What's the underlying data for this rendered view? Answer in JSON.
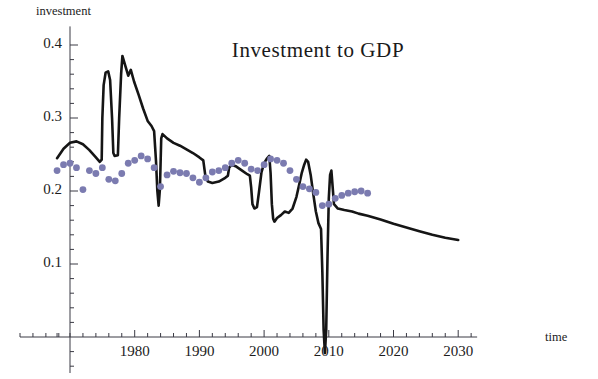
{
  "chart_data": {
    "type": "line",
    "title": "Investment to GDP",
    "xlabel": "time",
    "ylabel": "investment",
    "xlim": [
      1967,
      2032
    ],
    "ylim": [
      -0.03,
      0.42
    ],
    "grid": false,
    "legend": "none",
    "x_tick_labels": [
      "1980",
      "1990",
      "2000",
      "2010",
      "2020",
      "2030"
    ],
    "x_tick_values": [
      1980,
      1990,
      2000,
      2010,
      2020,
      2030
    ],
    "x_minor_tick_step": 2,
    "y_tick_labels": [
      "0.1",
      "0.2",
      "0.3",
      "0.4"
    ],
    "y_tick_values": [
      0.1,
      0.2,
      0.3,
      0.4
    ],
    "y_minor_tick_step": 0.02,
    "series": [
      {
        "name": "model-line",
        "type": "line",
        "color": "#151515",
        "width": 2.6,
        "points": [
          [
            1968.0,
            0.245
          ],
          [
            1969.0,
            0.258
          ],
          [
            1970.0,
            0.266
          ],
          [
            1971.0,
            0.268
          ],
          [
            1972.0,
            0.264
          ],
          [
            1973.0,
            0.256
          ],
          [
            1974.0,
            0.246
          ],
          [
            1974.6,
            0.24
          ],
          [
            1974.9,
            0.243
          ],
          [
            1975.0,
            0.3
          ],
          [
            1975.2,
            0.345
          ],
          [
            1975.5,
            0.362
          ],
          [
            1975.9,
            0.364
          ],
          [
            1976.2,
            0.352
          ],
          [
            1976.5,
            0.3
          ],
          [
            1976.7,
            0.252
          ],
          [
            1976.9,
            0.248
          ],
          [
            1977.4,
            0.249
          ],
          [
            1977.6,
            0.3
          ],
          [
            1977.9,
            0.36
          ],
          [
            1978.1,
            0.385
          ],
          [
            1978.6,
            0.37
          ],
          [
            1979.0,
            0.358
          ],
          [
            1979.4,
            0.366
          ],
          [
            1979.9,
            0.35
          ],
          [
            1980.6,
            0.332
          ],
          [
            1981.3,
            0.313
          ],
          [
            1982.0,
            0.296
          ],
          [
            1982.6,
            0.289
          ],
          [
            1983.0,
            0.282
          ],
          [
            1983.3,
            0.24
          ],
          [
            1983.5,
            0.2
          ],
          [
            1983.7,
            0.18
          ],
          [
            1983.9,
            0.203
          ],
          [
            1984.1,
            0.272
          ],
          [
            1984.3,
            0.278
          ],
          [
            1985.0,
            0.272
          ],
          [
            1986.0,
            0.266
          ],
          [
            1987.0,
            0.262
          ],
          [
            1988.0,
            0.257
          ],
          [
            1989.0,
            0.252
          ],
          [
            1990.0,
            0.246
          ],
          [
            1990.6,
            0.242
          ],
          [
            1990.9,
            0.222
          ],
          [
            1991.3,
            0.213
          ],
          [
            1992.0,
            0.211
          ],
          [
            1993.0,
            0.213
          ],
          [
            1993.6,
            0.216
          ],
          [
            1994.0,
            0.218
          ],
          [
            1994.4,
            0.221
          ],
          [
            1994.6,
            0.232
          ],
          [
            1995.0,
            0.236
          ],
          [
            1995.6,
            0.234
          ],
          [
            1996.6,
            0.228
          ],
          [
            1997.4,
            0.223
          ],
          [
            1997.8,
            0.221
          ],
          [
            1998.0,
            0.205
          ],
          [
            1998.2,
            0.182
          ],
          [
            1998.5,
            0.176
          ],
          [
            1998.9,
            0.178
          ],
          [
            1999.2,
            0.198
          ],
          [
            1999.6,
            0.226
          ],
          [
            2000.0,
            0.238
          ],
          [
            2000.4,
            0.244
          ],
          [
            2000.8,
            0.248
          ],
          [
            2001.0,
            0.225
          ],
          [
            2001.2,
            0.182
          ],
          [
            2001.4,
            0.162
          ],
          [
            2001.6,
            0.158
          ],
          [
            2002.0,
            0.163
          ],
          [
            2002.6,
            0.167
          ],
          [
            2003.2,
            0.172
          ],
          [
            2003.8,
            0.17
          ],
          [
            2004.4,
            0.176
          ],
          [
            2005.0,
            0.192
          ],
          [
            2005.4,
            0.208
          ],
          [
            2005.8,
            0.224
          ],
          [
            2006.2,
            0.236
          ],
          [
            2006.5,
            0.243
          ],
          [
            2006.8,
            0.24
          ],
          [
            2007.2,
            0.222
          ],
          [
            2007.6,
            0.196
          ],
          [
            2008.0,
            0.172
          ],
          [
            2008.4,
            0.156
          ],
          [
            2008.8,
            0.148
          ],
          [
            2009.0,
            0.09
          ],
          [
            2009.2,
            0.01
          ],
          [
            2009.4,
            -0.022
          ],
          [
            2009.6,
            0.01
          ],
          [
            2009.8,
            0.11
          ],
          [
            2010.0,
            0.19
          ],
          [
            2010.2,
            0.222
          ],
          [
            2010.4,
            0.228
          ],
          [
            2010.8,
            0.182
          ],
          [
            2011.4,
            0.176
          ],
          [
            2012.4,
            0.174
          ],
          [
            2013.6,
            0.172
          ],
          [
            2014.6,
            0.169
          ],
          [
            2016.0,
            0.166
          ],
          [
            2018.0,
            0.161
          ],
          [
            2020.0,
            0.155
          ],
          [
            2022.0,
            0.15
          ],
          [
            2024.0,
            0.145
          ],
          [
            2026.0,
            0.14
          ],
          [
            2028.0,
            0.136
          ],
          [
            2030.0,
            0.133
          ]
        ]
      },
      {
        "name": "data-dots",
        "type": "scatter",
        "color": "#7b7bb0",
        "radius": 3.4,
        "points": [
          [
            1968.0,
            0.228
          ],
          [
            1969.0,
            0.236
          ],
          [
            1970.0,
            0.238
          ],
          [
            1971.0,
            0.232
          ],
          [
            1972.0,
            0.202
          ],
          [
            1973.0,
            0.228
          ],
          [
            1974.0,
            0.224
          ],
          [
            1975.0,
            0.232
          ],
          [
            1976.0,
            0.216
          ],
          [
            1977.0,
            0.214
          ],
          [
            1978.0,
            0.224
          ],
          [
            1979.0,
            0.238
          ],
          [
            1980.0,
            0.242
          ],
          [
            1981.0,
            0.248
          ],
          [
            1982.0,
            0.244
          ],
          [
            1983.0,
            0.232
          ],
          [
            1984.0,
            0.206
          ],
          [
            1985.0,
            0.222
          ],
          [
            1986.0,
            0.227
          ],
          [
            1987.0,
            0.225
          ],
          [
            1988.0,
            0.224
          ],
          [
            1989.0,
            0.218
          ],
          [
            1990.0,
            0.212
          ],
          [
            1991.0,
            0.218
          ],
          [
            1992.0,
            0.226
          ],
          [
            1993.0,
            0.228
          ],
          [
            1994.0,
            0.232
          ],
          [
            1995.0,
            0.238
          ],
          [
            1996.0,
            0.242
          ],
          [
            1997.0,
            0.238
          ],
          [
            1998.0,
            0.23
          ],
          [
            1999.0,
            0.228
          ],
          [
            2000.0,
            0.236
          ],
          [
            2001.0,
            0.244
          ],
          [
            2002.0,
            0.242
          ],
          [
            2003.0,
            0.238
          ],
          [
            2004.0,
            0.228
          ],
          [
            2005.0,
            0.216
          ],
          [
            2006.0,
            0.206
          ],
          [
            2007.0,
            0.203
          ],
          [
            2008.0,
            0.198
          ],
          [
            2009.0,
            0.18
          ],
          [
            2010.0,
            0.182
          ],
          [
            2011.0,
            0.19
          ],
          [
            2012.0,
            0.194
          ],
          [
            2013.0,
            0.197
          ],
          [
            2014.0,
            0.199
          ],
          [
            2015.0,
            0.2
          ],
          [
            2016.0,
            0.197
          ]
        ]
      }
    ]
  }
}
